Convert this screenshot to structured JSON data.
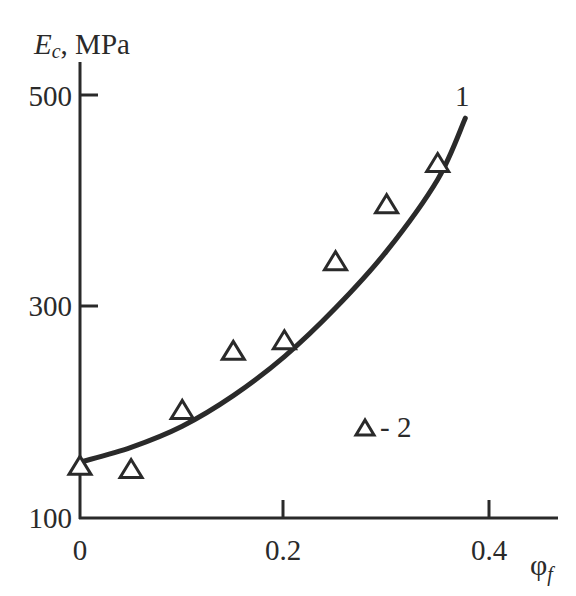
{
  "chart_data": {
    "type": "scatter",
    "title": "",
    "xlabel": "φf",
    "ylabel": "Ec, MPa",
    "xlim": [
      0,
      0.46
    ],
    "ylim": [
      100,
      530
    ],
    "x_ticks": [
      "0",
      "0.2",
      "0.4"
    ],
    "y_ticks": [
      "100",
      "300",
      "500"
    ],
    "grid": false,
    "series": [
      {
        "name": "1",
        "kind": "line",
        "x": [
          0,
          0.05,
          0.1,
          0.15,
          0.2,
          0.25,
          0.3,
          0.35,
          0.377
        ],
        "y": [
          152,
          166,
          186,
          215,
          252,
          298,
          352,
          420,
          478
        ]
      },
      {
        "name": "2",
        "kind": "scatter",
        "marker": "triangle-open",
        "x": [
          0,
          0.05,
          0.1,
          0.15,
          0.2,
          0.25,
          0.3,
          0.35
        ],
        "y": [
          148,
          145,
          201,
          257,
          267,
          342,
          396,
          435
        ]
      }
    ],
    "annotations": [
      {
        "text": "1",
        "x": 0.375,
        "y": 510
      },
      {
        "text": "△ - 2",
        "x": 0.29,
        "y": 187
      }
    ]
  },
  "labels": {
    "y_main": "E",
    "y_sub": "c",
    "y_unit": ", MPa",
    "x_main": "φ",
    "x_sub": "f",
    "curve_label": "1",
    "legend_text": "- 2"
  }
}
